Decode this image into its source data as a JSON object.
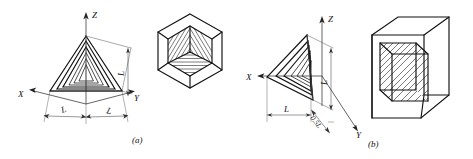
{
  "figure": {
    "background_color": "#ffffff",
    "line_color": "#111111",
    "construction_line_color": "#555555",
    "width": 473,
    "height": 159,
    "captions": [
      {
        "key": "a",
        "text": "(a)"
      },
      {
        "key": "b",
        "text": "(b)"
      }
    ],
    "panels": [
      {
        "key": "a",
        "caption": "(a)",
        "projection_type": "isometric",
        "axes": [
          {
            "name": "Z",
            "label": "Z",
            "direction": "up"
          },
          {
            "name": "X",
            "label": "X",
            "direction": "down-left"
          },
          {
            "name": "Y",
            "label": "Y",
            "direction": "down-right"
          }
        ],
        "dimensions": [
          {
            "label": "L",
            "placement": "bottom-left",
            "rotated": true
          },
          {
            "label": "L",
            "placement": "bottom-right",
            "rotated": true
          },
          {
            "label": "L",
            "placement": "right-vertical",
            "rotated": true
          }
        ],
        "pictorial": {
          "name": "hexagon-cube-with-corner-cavity",
          "outline": "hexagon",
          "hatched_faces": 3
        }
      },
      {
        "key": "b",
        "caption": "(b)",
        "projection_type": "oblique",
        "axes": [
          {
            "name": "Z",
            "label": "Z",
            "direction": "up"
          },
          {
            "name": "X",
            "label": "X",
            "direction": "left"
          },
          {
            "name": "Y",
            "label": "Y",
            "direction": "down-right-45"
          }
        ],
        "dimensions": [
          {
            "label": "L",
            "placement": "bottom-horizontal",
            "rotated": false
          },
          {
            "label": "0.5L",
            "placement": "bottom-oblique",
            "rotated": true
          },
          {
            "label": "L",
            "placement": "right-vertical",
            "rotated": true
          }
        ],
        "pictorial": {
          "name": "oblique-cube-with-cavity",
          "outline": "cube-oblique",
          "hatched_faces": 3
        }
      }
    ]
  }
}
